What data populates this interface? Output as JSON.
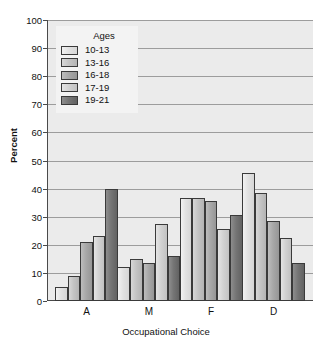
{
  "chart_data": {
    "type": "bar",
    "title": "",
    "xlabel": "Occupational Choice",
    "ylabel": "Percent",
    "categories": [
      "A",
      "M",
      "F",
      "D"
    ],
    "ylim": [
      0,
      100
    ],
    "yticks": [
      0,
      10,
      20,
      30,
      40,
      50,
      60,
      70,
      80,
      90,
      100
    ],
    "grid": true,
    "legend_title": "Ages",
    "legend_position": "top-left-inside",
    "series": [
      {
        "name": "10-13",
        "values": [
          5,
          12,
          36.5,
          45.5
        ],
        "color": "#e8e8e8"
      },
      {
        "name": "13-16",
        "values": [
          9,
          15,
          36.5,
          38.5
        ],
        "color": "#c4c4c4"
      },
      {
        "name": "16-18",
        "values": [
          21,
          13.5,
          35.5,
          28.5
        ],
        "color": "#a8a8a8"
      },
      {
        "name": "17-19",
        "values": [
          23,
          27.5,
          25.5,
          22.5
        ],
        "color": "#d6d6d6"
      },
      {
        "name": "19-21",
        "values": [
          40,
          16,
          30.5,
          13.5
        ],
        "color": "#757575"
      }
    ]
  }
}
